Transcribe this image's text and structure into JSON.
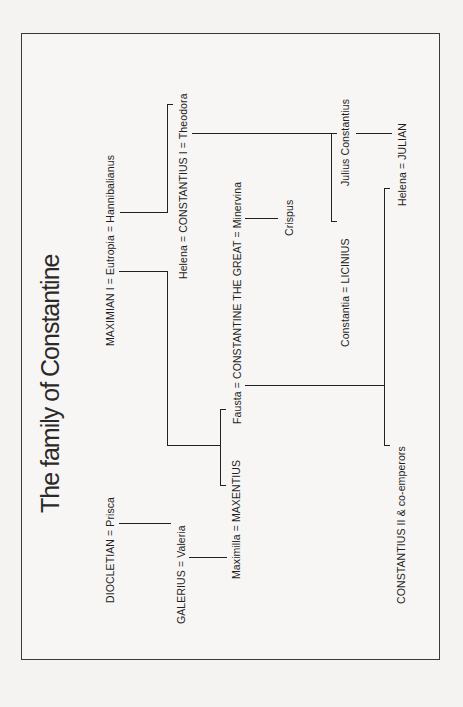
{
  "title": "The family of Constantine",
  "people": {
    "diocletian_prisca": "DIOCLETIAN = Prisca",
    "maximian_eutropia_hannibalianus": "MAXIMIAN I = Eutropia = Hannibalianus",
    "galerius_valeria": "GALERIUS = Valeria",
    "helena_constantius_theodora": "Helena = CONSTANTIUS I  = Theodora",
    "maximilla_maxentius": "Maximilla = MAXENTIUS",
    "fausta_constantine_minervina": "Fausta = CONSTANTINE THE GREAT = Minervina",
    "crispus": "Crispus",
    "constantia_licinius": "Constantia = LICINIUS",
    "julius_constantius": "Julius Constantius",
    "helena_julian": "Helena = JULIAN",
    "constantius_ii": "CONSTANTIUS II &  co-emperors"
  },
  "colors": {
    "background": "#f4f3f1",
    "line": "#222222",
    "text": "#1e1e1e"
  }
}
